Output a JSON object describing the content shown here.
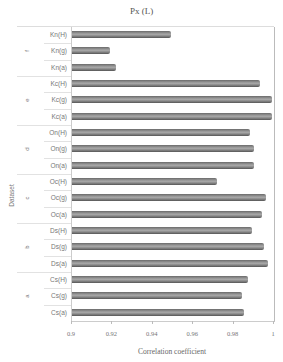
{
  "chart_data": {
    "type": "bar",
    "orientation": "horizontal",
    "title": "Px (L)",
    "xlabel": "Correlation coefficient",
    "ylabel": "Dataset",
    "xlim": [
      0.9,
      1.0
    ],
    "xticks": [
      "0.9",
      "0.92",
      "0.94",
      "0.96",
      "0.98",
      "1"
    ],
    "grid": false,
    "legend": null,
    "groups": [
      {
        "name": "f",
        "categories": [
          "Kn(H)",
          "Kn(g)",
          "Kn(a)"
        ],
        "values": [
          0.949,
          0.919,
          0.922
        ]
      },
      {
        "name": "e",
        "categories": [
          "Kc(H)",
          "Kc(g)",
          "Kc(a)"
        ],
        "values": [
          0.993,
          0.999,
          0.999
        ]
      },
      {
        "name": "d",
        "categories": [
          "On(H)",
          "On(g)",
          "On(a)"
        ],
        "values": [
          0.988,
          0.99,
          0.99
        ]
      },
      {
        "name": "c",
        "categories": [
          "Oc(H)",
          "Oc(g)",
          "Oc(a)"
        ],
        "values": [
          0.972,
          0.996,
          0.994
        ]
      },
      {
        "name": "b",
        "categories": [
          "Ds(H)",
          "Ds(g)",
          "Ds(a)"
        ],
        "values": [
          0.989,
          0.995,
          0.997
        ]
      },
      {
        "name": "a",
        "categories": [
          "Cs(H)",
          "Cs(g)",
          "Cs(a)"
        ],
        "values": [
          0.987,
          0.984,
          0.985
        ]
      }
    ],
    "categories": [
      "Kn(H)",
      "Kn(g)",
      "Kn(a)",
      "Kc(H)",
      "Kc(g)",
      "Kc(a)",
      "On(H)",
      "On(g)",
      "On(a)",
      "Oc(H)",
      "Oc(g)",
      "Oc(a)",
      "Ds(H)",
      "Ds(g)",
      "Ds(a)",
      "Cs(H)",
      "Cs(g)",
      "Cs(a)"
    ],
    "values": [
      0.949,
      0.919,
      0.922,
      0.993,
      0.999,
      0.999,
      0.988,
      0.99,
      0.99,
      0.972,
      0.996,
      0.994,
      0.989,
      0.995,
      0.997,
      0.987,
      0.984,
      0.985
    ],
    "bar_color": "#8a8a8a"
  }
}
